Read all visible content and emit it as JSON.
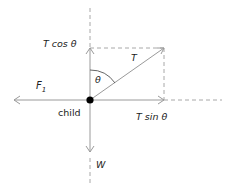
{
  "diagram": {
    "labels": {
      "t_cos": "T cos θ",
      "t_sin": "T sin θ",
      "tension": "T",
      "theta": "θ",
      "f1_main": "F",
      "f1_sub": "1",
      "child": "child",
      "weight": "W"
    },
    "colors": {
      "line": "#9a9a9a",
      "dashed": "#a8a8a8",
      "dot": "#000000",
      "text": "#222222"
    }
  }
}
